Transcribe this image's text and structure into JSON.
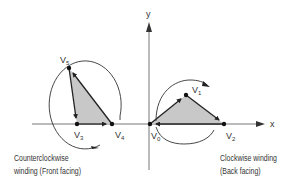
{
  "axes": {
    "x_label": "x",
    "y_label": "y"
  },
  "left_triangle": {
    "vertices": [
      {
        "name": "V",
        "sub": "5"
      },
      {
        "name": "V",
        "sub": "3"
      },
      {
        "name": "V",
        "sub": "4"
      }
    ],
    "caption_line1": "Counterclockwise",
    "caption_line2": "winding (Front facing)"
  },
  "right_triangle": {
    "vertices": [
      {
        "name": "V",
        "sub": "0"
      },
      {
        "name": "V",
        "sub": "1"
      },
      {
        "name": "V",
        "sub": "2"
      }
    ],
    "caption_line1": "Clockwise winding",
    "caption_line2": "(Back facing)"
  },
  "colors": {
    "fill": "#c8c8c8",
    "stroke": "#222222",
    "axis": "#777777"
  }
}
